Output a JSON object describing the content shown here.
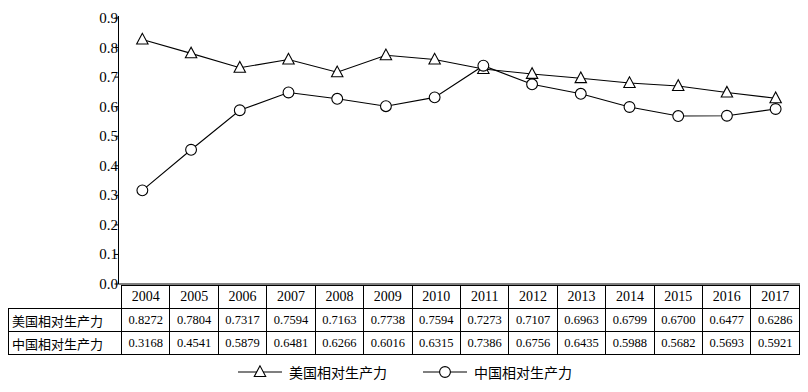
{
  "chart_data": {
    "type": "line",
    "title": "",
    "xlabel": "",
    "ylabel": "",
    "ylim": [
      0.0,
      0.9
    ],
    "grid": false,
    "legend_position": "bottom",
    "categories": [
      "2004",
      "2005",
      "2006",
      "2007",
      "2008",
      "2009",
      "2010",
      "2011",
      "2012",
      "2013",
      "2014",
      "2015",
      "2016",
      "2017"
    ],
    "y_ticks": [
      "0.0",
      "0.1",
      "0.2",
      "0.3",
      "0.4",
      "0.5",
      "0.6",
      "0.7",
      "0.8",
      "0.9"
    ],
    "y_tick_values": [
      0.0,
      0.1,
      0.2,
      0.3,
      0.4,
      0.5,
      0.6,
      0.7,
      0.8,
      0.9
    ],
    "series": [
      {
        "name": "美国相对生产力",
        "marker": "triangle",
        "color": "#000000",
        "values": [
          0.8272,
          0.7804,
          0.7317,
          0.7594,
          0.7163,
          0.7738,
          0.7594,
          0.7273,
          0.7107,
          0.6963,
          0.6799,
          0.67,
          0.6477,
          0.6286
        ],
        "labels": [
          "0.8272",
          "0.7804",
          "0.7317",
          "0.7594",
          "0.7163",
          "0.7738",
          "0.7594",
          "0.7273",
          "0.7107",
          "0.6963",
          "0.6799",
          "0.6700",
          "0.6477",
          "0.6286"
        ]
      },
      {
        "name": "中国相对生产力",
        "marker": "circle",
        "color": "#000000",
        "values": [
          0.3168,
          0.4541,
          0.5879,
          0.6481,
          0.6266,
          0.6016,
          0.6315,
          0.7386,
          0.6756,
          0.6435,
          0.5988,
          0.5682,
          0.5693,
          0.5921
        ],
        "labels": [
          "0.3168",
          "0.4541",
          "0.5879",
          "0.6481",
          "0.6266",
          "0.6016",
          "0.6315",
          "0.7386",
          "0.6756",
          "0.6435",
          "0.5988",
          "0.5682",
          "0.5693",
          "0.5921"
        ]
      }
    ]
  },
  "table": {
    "header_row": [
      "2004",
      "2005",
      "2006",
      "2007",
      "2008",
      "2009",
      "2010",
      "2011",
      "2012",
      "2013",
      "2014",
      "2015",
      "2016",
      "2017"
    ],
    "rows": [
      {
        "label": "美国相对生产力",
        "values": [
          "0.8272",
          "0.7804",
          "0.7317",
          "0.7594",
          "0.7163",
          "0.7738",
          "0.7594",
          "0.7273",
          "0.7107",
          "0.6963",
          "0.6799",
          "0.6700",
          "0.6477",
          "0.6286"
        ]
      },
      {
        "label": "中国相对生产力",
        "values": [
          "0.3168",
          "0.4541",
          "0.5879",
          "0.6481",
          "0.6266",
          "0.6016",
          "0.6315",
          "0.7386",
          "0.6756",
          "0.6435",
          "0.5988",
          "0.5682",
          "0.5693",
          "0.5921"
        ]
      }
    ]
  },
  "legend": {
    "items": [
      {
        "label": "美国相对生产力",
        "marker": "triangle"
      },
      {
        "label": "中国相对生产力",
        "marker": "circle"
      }
    ]
  }
}
